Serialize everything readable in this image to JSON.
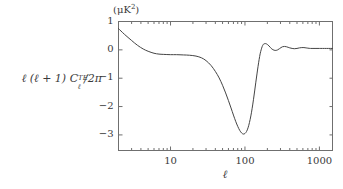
{
  "chart_data": {
    "type": "line",
    "title": "",
    "unit_label": "(μK²)",
    "ylabel": "ℓ (ℓ + 1) CℓTE/2π",
    "ylabel_parts": {
      "lead": "ℓ (ℓ + 1) ",
      "c": "C",
      "superscript": "TE",
      "subscript": "ℓ",
      "tail": "/2π"
    },
    "xlabel": "ℓ",
    "xscale": "log",
    "yscale": "linear",
    "xlim": [
      2,
      1500
    ],
    "ylim": [
      -3.55,
      1.0
    ],
    "grid": false,
    "legend": null,
    "xticks": [
      10,
      100,
      1000
    ],
    "xtick_labels": [
      "10",
      "100",
      "1000"
    ],
    "yticks": [
      1,
      0,
      -1,
      -2,
      -3
    ],
    "ytick_labels": [
      "1",
      "0",
      "−1",
      "−2",
      "−3"
    ],
    "series": [
      {
        "name": "TE cross power spectrum",
        "color": "#444444",
        "x": [
          2,
          2.4,
          3,
          3.6,
          4.3,
          5,
          6,
          7,
          8,
          10,
          12,
          15,
          18,
          22,
          26,
          30,
          35,
          40,
          45,
          50,
          55,
          60,
          65,
          70,
          75,
          80,
          85,
          90,
          95,
          100,
          105,
          110,
          115,
          120,
          125,
          130,
          135,
          140,
          145,
          150,
          155,
          160,
          165,
          170,
          175,
          180,
          190,
          200,
          210,
          220,
          230,
          245,
          260,
          275,
          290,
          305,
          320,
          340,
          360,
          380,
          400,
          430,
          460,
          500,
          540,
          580,
          620,
          660,
          700,
          760,
          820,
          900,
          1000,
          1100,
          1250,
          1400,
          1500
        ],
        "y": [
          0.75,
          0.55,
          0.33,
          0.16,
          0.03,
          -0.05,
          -0.12,
          -0.15,
          -0.16,
          -0.17,
          -0.17,
          -0.18,
          -0.19,
          -0.22,
          -0.28,
          -0.38,
          -0.55,
          -0.76,
          -0.99,
          -1.25,
          -1.52,
          -1.79,
          -2.05,
          -2.3,
          -2.52,
          -2.7,
          -2.84,
          -2.93,
          -2.97,
          -2.95,
          -2.88,
          -2.75,
          -2.56,
          -2.33,
          -2.06,
          -1.76,
          -1.45,
          -1.14,
          -0.85,
          -0.58,
          -0.34,
          -0.14,
          0.0,
          0.11,
          0.18,
          0.21,
          0.22,
          0.19,
          0.14,
          0.08,
          0.03,
          -0.01,
          -0.02,
          0.0,
          0.04,
          0.08,
          0.11,
          0.12,
          0.11,
          0.09,
          0.07,
          0.05,
          0.04,
          0.05,
          0.07,
          0.08,
          0.08,
          0.07,
          0.06,
          0.05,
          0.05,
          0.05,
          0.05,
          0.05,
          0.05,
          0.05,
          0.05
        ]
      }
    ]
  },
  "axes": {
    "frame_color": "#6f6f6f",
    "tick_color": "#6f6f6f"
  }
}
